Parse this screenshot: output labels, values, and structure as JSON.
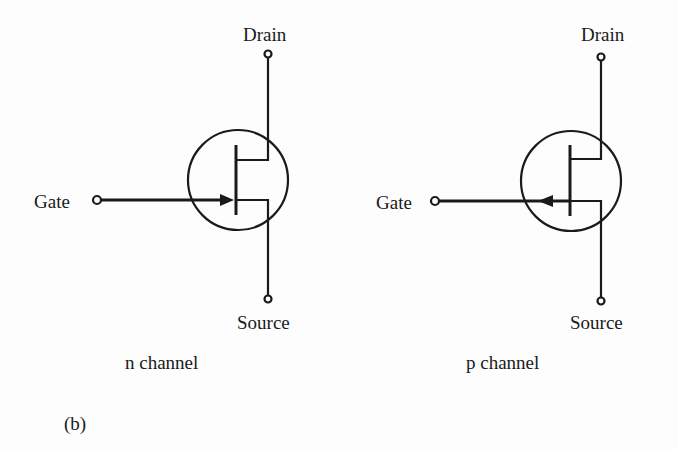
{
  "figure_label": "(b)",
  "transistors": [
    {
      "name": "n channel",
      "caption": "n channel",
      "terminals": {
        "drain": "Drain",
        "gate": "Gate",
        "source": "Source"
      },
      "arrow_direction": "inward"
    },
    {
      "name": "p channel",
      "caption": "p channel",
      "terminals": {
        "drain": "Drain",
        "gate": "Gate",
        "source": "Source"
      },
      "arrow_direction": "outward"
    }
  ],
  "colors": {
    "ink": "#1a1a1a",
    "background": "#fdfdfd"
  }
}
